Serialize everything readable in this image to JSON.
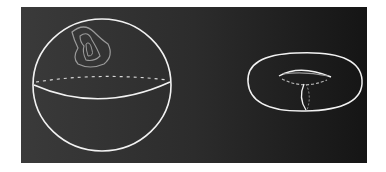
{
  "figure": {
    "background_color": "#ffffff",
    "board_color": "#2a2a2a",
    "chalk_color": "#f2f2f2",
    "faint_chalk_color": "#9a9a9a",
    "shapes": [
      {
        "name": "sphere",
        "features": [
          "outline",
          "equator (front solid, back dashed)",
          "contractible contour loops"
        ]
      },
      {
        "name": "torus",
        "features": [
          "outline",
          "inner hole",
          "meridian loop",
          "dashed hidden curve"
        ]
      }
    ]
  }
}
